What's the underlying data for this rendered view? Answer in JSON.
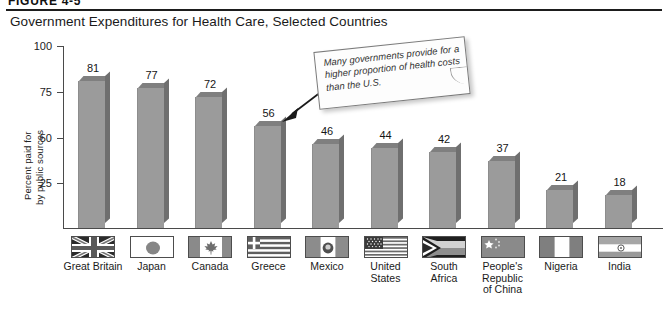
{
  "figure": {
    "number_label": "FIGURE 4-5",
    "title": "Government Expenditures for Health Care, Selected Countries"
  },
  "callout": {
    "name": "callout-note",
    "text": "Many governments provide for a higher proportion of health costs than the U.S.",
    "pointer_target": "Greece"
  },
  "chart_data": {
    "type": "bar",
    "title": "Government Expenditures for Health Care, Selected Countries",
    "xlabel": "",
    "ylabel": "Percent paid for by public sources",
    "ylabel_lines": [
      "Percent paid for",
      "by public sources"
    ],
    "ylim": [
      0,
      100
    ],
    "yticks": [
      25,
      50,
      75,
      100
    ],
    "ytick_labels": [
      "25",
      "50",
      "75",
      "100"
    ],
    "grid": false,
    "legend": null,
    "categories": [
      "Great Britain",
      "Japan",
      "Canada",
      "Greece",
      "Mexico",
      "United States",
      "South Africa",
      "People's Republic of China",
      "Nigeria",
      "India"
    ],
    "category_label_lines": [
      [
        "Great Britain"
      ],
      [
        "Japan"
      ],
      [
        "Canada"
      ],
      [
        "Greece"
      ],
      [
        "Mexico"
      ],
      [
        "United",
        "States"
      ],
      [
        "South",
        "Africa"
      ],
      [
        "People's",
        "Republic",
        "of China"
      ],
      [
        "Nigeria"
      ],
      [
        "India"
      ]
    ],
    "values": [
      81,
      77,
      72,
      56,
      46,
      44,
      42,
      37,
      21,
      18
    ],
    "value_labels": [
      "81",
      "77",
      "72",
      "56",
      "46",
      "44",
      "42",
      "37",
      "21",
      "18"
    ],
    "flag_icons": [
      "flag-great-britain-icon",
      "flag-japan-icon",
      "flag-canada-icon",
      "flag-greece-icon",
      "flag-mexico-icon",
      "flag-united-states-icon",
      "flag-south-africa-icon",
      "flag-china-icon",
      "flag-nigeria-icon",
      "flag-india-icon"
    ]
  },
  "colors": {
    "bar_face": "#9b9b9b",
    "bar_top": "#7f7f7f",
    "bar_side": "#6f6f6f",
    "axis": "#4a4a4a",
    "rule": "#1d1d1d",
    "text": "#1a1a1a",
    "background": "#ffffff"
  }
}
